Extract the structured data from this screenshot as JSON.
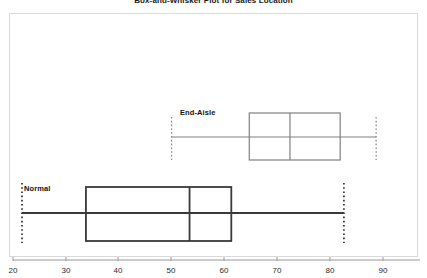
{
  "chart_data": {
    "type": "box",
    "title": "Box-and-Whisker Plot for Sales Location",
    "xlabel": "",
    "ylabel": "",
    "orientation": "horizontal",
    "xlim": [
      18,
      95
    ],
    "grid": false,
    "legend": "none",
    "xticks": [
      20,
      30,
      40,
      50,
      60,
      70,
      80,
      90
    ],
    "xtick_labels": [
      "20",
      "30",
      "40",
      "50",
      "60",
      "70",
      "80",
      "90"
    ],
    "categories": [
      "End-Aisle",
      "Normal"
    ],
    "boxes": [
      {
        "name": "End-Aisle",
        "min": 50.0,
        "q1": 64.7,
        "median": 72.4,
        "q3": 81.9,
        "max": 88.7,
        "box_color": "#ffffff",
        "line_color": "#808080"
      },
      {
        "name": "Normal",
        "min": 21.7,
        "q1": 33.8,
        "median": 53.4,
        "q3": 61.3,
        "max": 82.6,
        "box_color": "#ffffff",
        "line_color": "#3a3a3a"
      }
    ]
  },
  "axis": {
    "ticks": [
      {
        "value": "20",
        "px": 13
      },
      {
        "value": "30",
        "px": 66
      },
      {
        "value": "40",
        "px": 118
      },
      {
        "value": "50",
        "px": 171
      },
      {
        "value": "60",
        "px": 224
      },
      {
        "value": "70",
        "px": 277
      },
      {
        "value": "80",
        "px": 330
      },
      {
        "value": "90",
        "px": 383
      }
    ],
    "line_color": "#9a9a9a"
  },
  "labels": {
    "end_aisle": "End-Aisle",
    "normal": "Normal"
  },
  "colors": {
    "frame": "#d9d9d9",
    "axis": "#9a9a9a",
    "end_aisle_line": "#808080",
    "normal_line": "#3a3a3a",
    "text": "#1a1a1a",
    "background": "#ffffff"
  }
}
